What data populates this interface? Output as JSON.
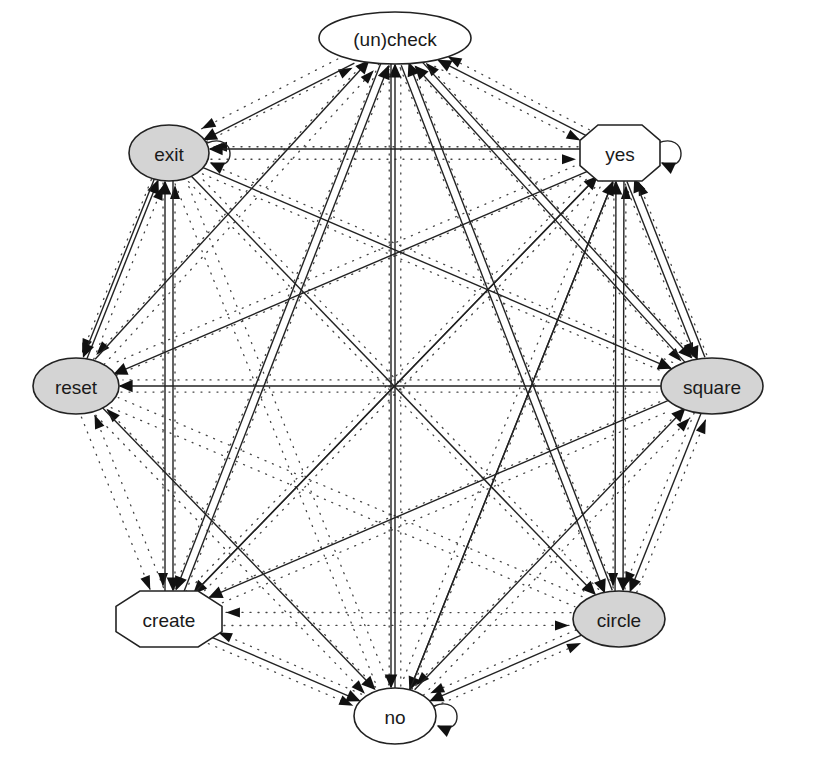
{
  "diagram": {
    "type": "directed-graph",
    "colors": {
      "filled_node": "#d4d4d4",
      "plain_node": "#ffffff",
      "stroke": "#222222"
    },
    "nodes": [
      {
        "id": "uncheck",
        "label": "(un)check",
        "shape": "ellipse",
        "filled": false,
        "cx": 395,
        "cy": 38,
        "rx": 76,
        "ry": 26
      },
      {
        "id": "yes",
        "label": "yes",
        "shape": "octagon",
        "filled": false,
        "cx": 620,
        "cy": 153,
        "rx": 40,
        "ry": 28
      },
      {
        "id": "square",
        "label": "square",
        "shape": "ellipse",
        "filled": true,
        "cx": 712,
        "cy": 386,
        "rx": 51,
        "ry": 28
      },
      {
        "id": "circle",
        "label": "circle",
        "shape": "ellipse",
        "filled": true,
        "cx": 619,
        "cy": 619,
        "rx": 46,
        "ry": 28
      },
      {
        "id": "no",
        "label": "no",
        "shape": "ellipse",
        "filled": false,
        "cx": 395,
        "cy": 716,
        "rx": 41,
        "ry": 28
      },
      {
        "id": "create",
        "label": "create",
        "shape": "octagon",
        "filled": false,
        "cx": 169,
        "cy": 619,
        "rx": 53,
        "ry": 28
      },
      {
        "id": "reset",
        "label": "reset",
        "shape": "ellipse",
        "filled": true,
        "cx": 76,
        "cy": 386,
        "rx": 43,
        "ry": 28
      },
      {
        "id": "exit",
        "label": "exit",
        "shape": "ellipse",
        "filled": true,
        "cx": 169,
        "cy": 153,
        "rx": 40,
        "ry": 28
      }
    ],
    "solid_edges": [
      {
        "from": "uncheck",
        "to": "exit"
      },
      {
        "from": "exit",
        "to": "exit"
      },
      {
        "from": "yes",
        "to": "yes"
      },
      {
        "from": "no",
        "to": "no"
      },
      {
        "from": "yes",
        "to": "uncheck"
      },
      {
        "from": "yes",
        "to": "exit"
      },
      {
        "from": "reset",
        "to": "uncheck"
      },
      {
        "from": "reset",
        "to": "exit"
      },
      {
        "from": "exit",
        "to": "reset"
      },
      {
        "from": "yes",
        "to": "reset"
      },
      {
        "from": "square",
        "to": "reset"
      },
      {
        "from": "create",
        "to": "uncheck"
      },
      {
        "from": "create",
        "to": "exit"
      },
      {
        "from": "no",
        "to": "uncheck"
      },
      {
        "from": "circle",
        "to": "uncheck"
      },
      {
        "from": "square",
        "to": "uncheck"
      },
      {
        "from": "exit",
        "to": "square"
      },
      {
        "from": "yes",
        "to": "square"
      },
      {
        "from": "uncheck",
        "to": "square"
      },
      {
        "from": "exit",
        "to": "circle"
      },
      {
        "from": "uncheck",
        "to": "circle"
      },
      {
        "from": "yes",
        "to": "circle"
      },
      {
        "from": "square",
        "to": "circle"
      },
      {
        "from": "uncheck",
        "to": "create"
      },
      {
        "from": "exit",
        "to": "create"
      },
      {
        "from": "yes",
        "to": "create"
      },
      {
        "from": "square",
        "to": "create"
      },
      {
        "from": "reset",
        "to": "no"
      },
      {
        "from": "create",
        "to": "no"
      },
      {
        "from": "uncheck",
        "to": "no"
      },
      {
        "from": "yes",
        "to": "no"
      },
      {
        "from": "circle",
        "to": "no"
      },
      {
        "from": "no",
        "to": "yes"
      },
      {
        "from": "circle",
        "to": "yes"
      },
      {
        "from": "create",
        "to": "yes"
      },
      {
        "from": "square",
        "to": "yes"
      },
      {
        "from": "no",
        "to": "square"
      }
    ],
    "dotted_edges_note": "complete set of dotted edges between all node pairs"
  }
}
